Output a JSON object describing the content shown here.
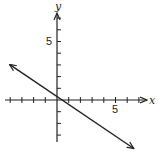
{
  "chart_data": {
    "type": "line",
    "title": "",
    "xlabel": "x",
    "ylabel": "y",
    "xlim": [
      -4.5,
      7
    ],
    "ylim": [
      -4.5,
      7.5
    ],
    "grid": false,
    "x_tick_labels": [
      {
        "value": 5,
        "label": "5"
      }
    ],
    "y_tick_labels": [
      {
        "value": 5,
        "label": "5"
      }
    ],
    "series": [
      {
        "name": "line",
        "equation": "y = -(2/3)x + 1/3",
        "x": [
          -4,
          6.5
        ],
        "y": [
          3,
          -4.1
        ],
        "arrows": "both"
      }
    ]
  },
  "labels": {
    "x_axis": "x",
    "y_axis": "y",
    "x_five": "5",
    "y_five": "5"
  }
}
